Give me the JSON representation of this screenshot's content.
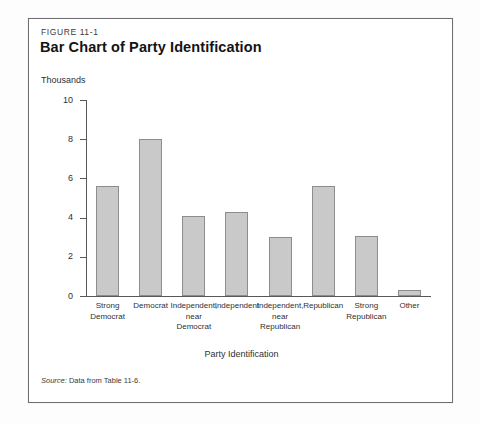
{
  "figure": {
    "number": "FIGURE 11-1",
    "title": "Bar Chart of Party Identification",
    "source_word": "Source:",
    "source_text": " Data from Table 11-6."
  },
  "chart_data": {
    "type": "bar",
    "title": "Bar Chart of Party Identification",
    "subtitle": "FIGURE 11-1",
    "xlabel": "Party Identification",
    "ylabel": "Thousands",
    "ylim": [
      0,
      10
    ],
    "yticks": [
      "0",
      "2",
      "4",
      "6",
      "8",
      "10"
    ],
    "ytick_values": [
      0,
      2,
      4,
      6,
      8,
      10
    ],
    "grid": false,
    "legend": "none",
    "bar_color": "#c9c9c9",
    "bar_border_color": "#8d8d90",
    "categories": [
      "Strong Democrat",
      "Democrat",
      "Independent, near Democrat",
      "Independent",
      "Independent, near Republican",
      "Republican",
      "Strong Republican",
      "Other"
    ],
    "category_lines": [
      [
        "Strong",
        "Democrat"
      ],
      [
        "Democrat"
      ],
      [
        "Independent,",
        "near",
        "Democrat"
      ],
      [
        "Independent"
      ],
      [
        "Independent,",
        "near",
        "Republican"
      ],
      [
        "Republican"
      ],
      [
        "Strong",
        "Republican"
      ],
      [
        "Other"
      ]
    ],
    "values": [
      5.6,
      8.0,
      4.1,
      4.3,
      3.0,
      5.6,
      3.05,
      0.3
    ]
  }
}
